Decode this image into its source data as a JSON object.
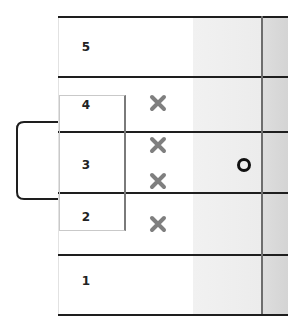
{
  "diagram": {
    "rows": [
      {
        "label": "5"
      },
      {
        "label": "4"
      },
      {
        "label": "3"
      },
      {
        "label": "2"
      },
      {
        "label": "1"
      }
    ],
    "grouped_rows": [
      "4",
      "3",
      "2"
    ],
    "x_marks_count": 4,
    "circle_marks_count": 1,
    "colors": {
      "line": "#1e1e1e",
      "x_mark": "#7f7f7f",
      "circle": "#111111",
      "shade_light": "#eeeeee",
      "shade_dark": "#d8d8d8"
    }
  }
}
